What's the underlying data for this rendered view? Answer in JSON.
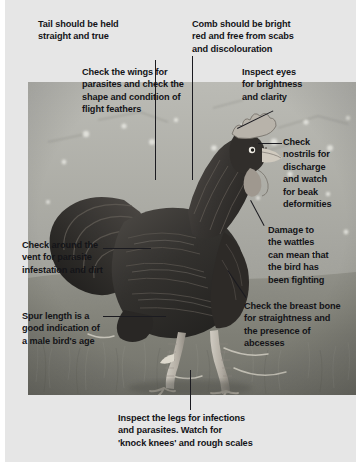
{
  "figure": {
    "background_color": "#e6e6e6",
    "text_color": "#141418",
    "leader_line_color": "#1b1b20"
  },
  "annotations": {
    "tail": "Tail should be held\nstraight and true",
    "comb": "Comb should be bright\nred and free from scabs\nand discolouration",
    "wings": "Check the wings for\nparasites and check the\nshape and condition of\nflight feathers",
    "eyes": "Inspect eyes\nfor brightness\nand clarity",
    "nostrils": "Check\nnostrils for\ndischarge\nand watch\nfor beak\ndeformities",
    "wattles": "Damage to\nthe wattles\ncan mean that\nthe bird has\nbeen fighting",
    "vent": "Check around the\nvent for parasite\ninfestation and dirt",
    "breast": "Check the breast bone\nfor straightness and\nthe presence of\nabcesses",
    "spur": "Spur length is a\ngood indication of\na male bird's age",
    "legs": "Inspect the legs for infections\nand parasites. Watch for\n'knock knees' and rough scales"
  }
}
